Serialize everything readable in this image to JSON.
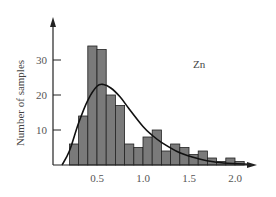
{
  "chart_data": {
    "type": "bar",
    "title": "",
    "annotation": "Zn",
    "xlabel": "",
    "ylabel": "Number of samples",
    "xlim": [
      0.0,
      2.3
    ],
    "ylim": [
      0,
      38
    ],
    "x_ticks": [
      0.5,
      1.0,
      1.5,
      2.0
    ],
    "x_tick_labels": [
      "0.5",
      "1.0",
      "1.5",
      "2.0"
    ],
    "y_ticks": [
      10,
      20,
      30
    ],
    "y_tick_labels": [
      "10",
      "20",
      "30"
    ],
    "grid": false,
    "legend": null,
    "bin_width": 0.1,
    "bins": [
      {
        "x0": 0.2,
        "count": 6
      },
      {
        "x0": 0.3,
        "count": 14
      },
      {
        "x0": 0.4,
        "count": 34
      },
      {
        "x0": 0.5,
        "count": 33
      },
      {
        "x0": 0.6,
        "count": 20
      },
      {
        "x0": 0.7,
        "count": 17
      },
      {
        "x0": 0.8,
        "count": 6
      },
      {
        "x0": 0.9,
        "count": 5
      },
      {
        "x0": 1.0,
        "count": 8
      },
      {
        "x0": 1.1,
        "count": 10
      },
      {
        "x0": 1.2,
        "count": 4
      },
      {
        "x0": 1.3,
        "count": 6
      },
      {
        "x0": 1.4,
        "count": 5
      },
      {
        "x0": 1.5,
        "count": 3
      },
      {
        "x0": 1.6,
        "count": 4
      },
      {
        "x0": 1.7,
        "count": 2
      },
      {
        "x0": 1.8,
        "count": 1
      },
      {
        "x0": 1.9,
        "count": 2
      },
      {
        "x0": 2.0,
        "count": 1
      }
    ],
    "fit_curve": {
      "type": "lognormal-like",
      "peak_x": 0.57,
      "peak_y": 23,
      "points": [
        [
          0.12,
          0
        ],
        [
          0.2,
          4
        ],
        [
          0.3,
          12
        ],
        [
          0.4,
          18.5
        ],
        [
          0.5,
          22.5
        ],
        [
          0.57,
          23
        ],
        [
          0.65,
          22
        ],
        [
          0.75,
          19.5
        ],
        [
          0.85,
          16
        ],
        [
          1.0,
          11
        ],
        [
          1.1,
          8.5
        ],
        [
          1.2,
          6.5
        ],
        [
          1.4,
          3.5
        ],
        [
          1.6,
          1.8
        ],
        [
          1.8,
          0.8
        ],
        [
          2.0,
          0.4
        ],
        [
          2.15,
          0.2
        ]
      ]
    },
    "colors": {
      "bar_fill": "#7a7a7a",
      "bar_stroke": "#222222",
      "curve": "#111111",
      "axis": "#222222"
    }
  }
}
